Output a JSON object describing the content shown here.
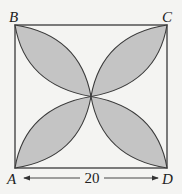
{
  "diagram": {
    "type": "geometry-figure",
    "vertices": {
      "A": "A",
      "B": "B",
      "C": "C",
      "D": "D"
    },
    "side_length_label": "20",
    "colors": {
      "shade": "#c4c4c4",
      "stroke": "#3a3a3a",
      "background": "#f4f4f2"
    }
  }
}
